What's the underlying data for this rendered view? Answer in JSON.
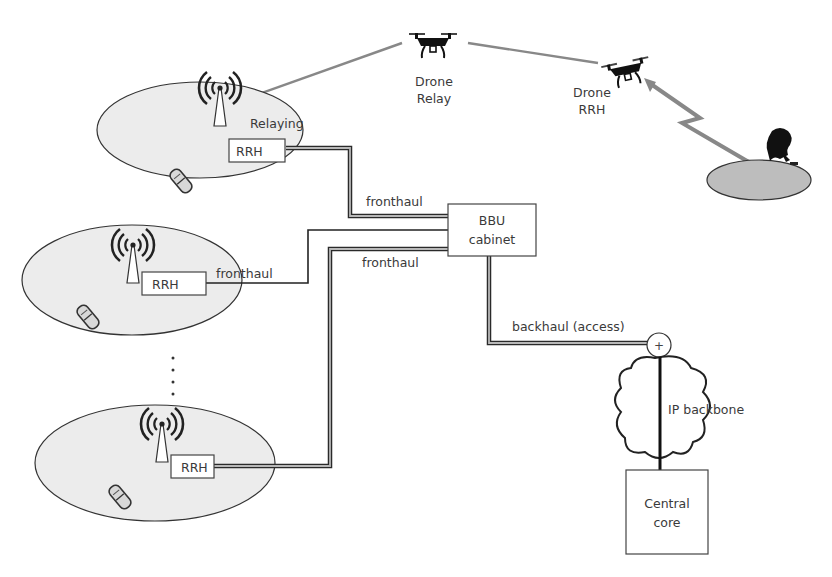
{
  "diagram": {
    "title": "",
    "colors": {
      "cell_fill": "#ececec",
      "ground_fill": "#bdbdbd",
      "link_dark": "#2a2a2a",
      "link_light": "#b8b8b8",
      "radio_link": "#888888",
      "text": "#3a3a3a"
    },
    "nodes": {
      "drone_relay": {
        "label_line1": "Drone",
        "label_line2": "Relay"
      },
      "drone_rrh": {
        "label_line1": "Drone",
        "label_line2": "RRH"
      },
      "cell_top": {
        "rrh_label": "RRH",
        "annotation": "Relaying"
      },
      "cell_middle": {
        "rrh_label": "RRH"
      },
      "cell_bottom": {
        "rrh_label": "RRH"
      },
      "bbu": {
        "label_line1": "BBU",
        "label_line2": "cabinet"
      },
      "aggregation_node": {
        "symbol": "+"
      },
      "ip_backbone": {
        "label": "IP backbone"
      },
      "central_core": {
        "label_line1": "Central",
        "label_line2": "core"
      },
      "ellipsis": {
        "label": "⋮"
      }
    },
    "links": {
      "fronthaul_top": "fronthaul",
      "fronthaul_middle": "fronthaul",
      "fronthaul_bottom": "fronthaul",
      "backhaul": "backhaul (access)"
    }
  }
}
